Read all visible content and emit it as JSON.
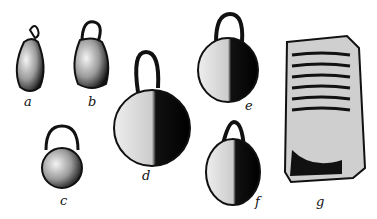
{
  "figure": {
    "items": [
      {
        "id": "a",
        "label": "a"
      },
      {
        "id": "b",
        "label": "b"
      },
      {
        "id": "c",
        "label": "c"
      },
      {
        "id": "d",
        "label": "d"
      },
      {
        "id": "e",
        "label": "e"
      },
      {
        "id": "f",
        "label": "f"
      },
      {
        "id": "g",
        "label": "g"
      }
    ]
  }
}
